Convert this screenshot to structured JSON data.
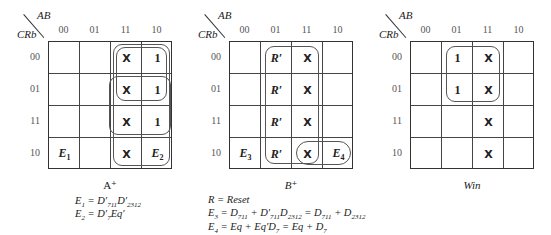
{
  "corner": {
    "top_label": "AB",
    "left_label": "CRb"
  },
  "column_labels": [
    "00",
    "01",
    "11",
    "10"
  ],
  "row_labels": [
    "00",
    "01",
    "11",
    "10"
  ],
  "maps": [
    {
      "id": "A",
      "caption": "A⁺",
      "cells": [
        [
          "",
          "",
          "X",
          "1"
        ],
        [
          "",
          "",
          "X",
          "1"
        ],
        [
          "",
          "",
          "X",
          "1"
        ],
        [
          "E1",
          "",
          "X",
          "E2"
        ]
      ],
      "equations": [
        "E₁ = D′₇₁₁D′₂₃₁₂",
        "E₂ = D′₇Eq′"
      ]
    },
    {
      "id": "B",
      "caption": "B⁺",
      "cells": [
        [
          "",
          "R′",
          "X",
          ""
        ],
        [
          "",
          "R′",
          "X",
          ""
        ],
        [
          "",
          "R′",
          "X",
          ""
        ],
        [
          "E3",
          "R′",
          "X",
          "E4"
        ]
      ],
      "equations": [
        "R = Reset",
        "E₃ = D₇₁₁ + D′₇₁₁D₂₃₁₂ = D₇₁₁ + D₂₃₁₂",
        "E₄ = Eq + Eq′D₇ = Eq + D₇"
      ]
    },
    {
      "id": "Win",
      "caption": "Win",
      "cells": [
        [
          "",
          "1",
          "X",
          ""
        ],
        [
          "",
          "1",
          "X",
          ""
        ],
        [
          "",
          "",
          "X",
          ""
        ],
        [
          "",
          "",
          "X",
          ""
        ]
      ],
      "equations": []
    }
  ]
}
